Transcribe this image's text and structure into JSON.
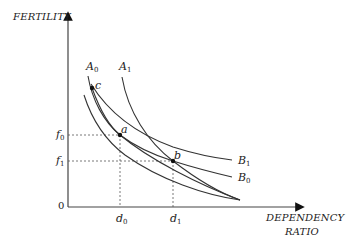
{
  "diagram": {
    "y_axis_label": "FERTILITY",
    "x_axis_label_line1": "DEPENDENCY",
    "x_axis_label_line2": "RATIO",
    "origin_label": "0",
    "y_ticks": [
      {
        "base": "f",
        "sub": "0"
      },
      {
        "base": "f",
        "sub": "1"
      }
    ],
    "x_ticks": [
      {
        "base": "d",
        "sub": "0"
      },
      {
        "base": "d",
        "sub": "1"
      }
    ],
    "curves": [
      {
        "base": "A",
        "sub": "0"
      },
      {
        "base": "A",
        "sub": "1"
      },
      {
        "base": "B",
        "sub": "0"
      },
      {
        "base": "B",
        "sub": "1"
      }
    ],
    "points": {
      "a": "a",
      "b": "b",
      "c": "c"
    },
    "line_color": "#333333",
    "guide_color": "#555555"
  }
}
